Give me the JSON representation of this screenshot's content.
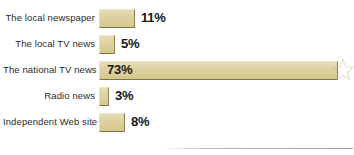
{
  "chart_data": {
    "type": "bar",
    "orientation": "horizontal",
    "title": "",
    "subtitle": "",
    "xlabel": "",
    "ylabel": "",
    "categories": [
      "The local newspaper",
      "The local TV news",
      "The national TV news",
      "Radio news",
      "Independent Web site"
    ],
    "values": [
      11,
      5,
      73,
      3,
      8
    ],
    "value_labels": [
      "11%",
      "5%",
      "73%",
      "3%",
      "8%"
    ],
    "units": "percent",
    "xlim": [
      0,
      80
    ],
    "grid": false,
    "legend": null,
    "annotations": [
      "star-watermark at end of 73% bar"
    ],
    "colors": {
      "bar_fill": "#ded2a2",
      "bar_fill_light": "#e6dcb4",
      "bar_fill_dark": "#d5c88c",
      "bar_edge_dark": "#7e7240",
      "bar_edge_light": "#efe8cc",
      "label_text": "#2b2b2b",
      "value_text": "#151515",
      "background": "#ffffff",
      "rule": "#9f9f9f"
    }
  },
  "rows": [
    {
      "label": "The local newspaper",
      "value": 11,
      "value_label": "11%",
      "label_inside": false
    },
    {
      "label": "The local TV news",
      "value": 5,
      "value_label": "5%",
      "label_inside": false
    },
    {
      "label": "The national TV news",
      "value": 73,
      "value_label": "73%",
      "label_inside": true
    },
    {
      "label": "Radio news",
      "value": 3,
      "value_label": "3%",
      "label_inside": false
    },
    {
      "label": "Independent Web site",
      "value": 8,
      "value_label": "8%",
      "label_inside": false
    }
  ],
  "layout": {
    "row_height": 26,
    "first_row_top": 5,
    "bar_origin_x": 99,
    "px_per_percent": 3.27,
    "bar_height": 19
  },
  "decor": {
    "star_label": "star-watermark",
    "rule_label": "baseline-rule"
  }
}
